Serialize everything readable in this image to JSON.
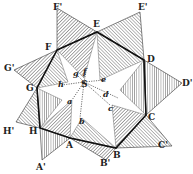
{
  "figure": {
    "colors": {
      "ink": "#222222",
      "hatch": "#555555",
      "paper": "#ffffff"
    },
    "outer_labels": [
      "F'",
      "E'",
      "D'",
      "C'",
      "B'",
      "A'",
      "H'",
      "G'"
    ],
    "vertex_labels": [
      "F",
      "E",
      "D",
      "C",
      "B",
      "A",
      "H",
      "G"
    ],
    "center_label": "S",
    "inner_labels": [
      "a",
      "b",
      "c",
      "d",
      "e",
      "f",
      "g",
      "h"
    ]
  }
}
